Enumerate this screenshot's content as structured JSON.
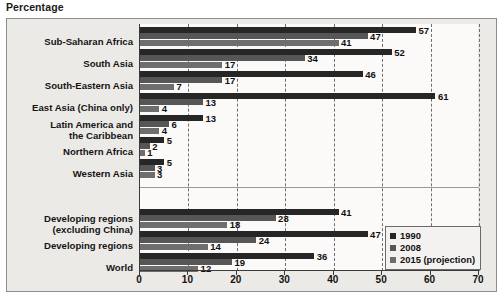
{
  "axis_title": "Percentage",
  "legend": {
    "position": "bottom-right",
    "items": [
      {
        "label": "1990",
        "color": "#262626"
      },
      {
        "label": "2008",
        "color": "#565656"
      },
      {
        "label": "2015 (projection)",
        "color": "#6e6e6e"
      }
    ]
  },
  "xaxis": {
    "ticks": [
      "0",
      "10",
      "20",
      "30",
      "40",
      "50",
      "60",
      "70"
    ]
  },
  "chart_data": {
    "type": "bar",
    "orientation": "horizontal",
    "title": "",
    "xlabel": "Percentage",
    "ylabel": "",
    "xlim": [
      0,
      70
    ],
    "xticks": [
      0,
      10,
      20,
      30,
      40,
      50,
      60,
      70
    ],
    "grid": "vertical-dashed",
    "legend_position": "bottom-right",
    "categories": [
      "Sub-Saharan Africa",
      "South Asia",
      "South-Eastern Asia",
      "East Asia (China only)",
      "Latin America and\nthe Caribbean",
      "Northern Africa",
      "Western Asia",
      "Developing regions\n(excluding China)",
      "Developing regions",
      "World"
    ],
    "series": [
      {
        "name": "1990",
        "color": "#262626",
        "values": [
          57,
          52,
          46,
          61,
          13,
          5,
          5,
          41,
          47,
          36
        ]
      },
      {
        "name": "2008",
        "color": "#565656",
        "values": [
          47,
          34,
          17,
          13,
          6,
          2,
          3,
          28,
          24,
          19
        ]
      },
      {
        "name": "2015 (projection)",
        "color": "#6e6e6e",
        "values": [
          41,
          17,
          7,
          4,
          4,
          1,
          3,
          18,
          14,
          12
        ]
      }
    ],
    "group_separator_after_category_index": 6
  }
}
